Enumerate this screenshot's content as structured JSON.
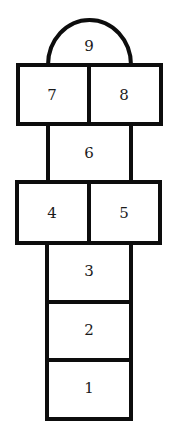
{
  "diagram": {
    "stroke_color": "#0d0d0d",
    "background": "#ffffff",
    "squares": [
      {
        "id": "sq9",
        "label": "9",
        "shape": "semicircle"
      },
      {
        "id": "sq7",
        "label": "7",
        "shape": "rect"
      },
      {
        "id": "sq8",
        "label": "8",
        "shape": "rect"
      },
      {
        "id": "sq6",
        "label": "6",
        "shape": "rect"
      },
      {
        "id": "sq4",
        "label": "4",
        "shape": "rect"
      },
      {
        "id": "sq5",
        "label": "5",
        "shape": "rect"
      },
      {
        "id": "sq3",
        "label": "3",
        "shape": "rect"
      },
      {
        "id": "sq2",
        "label": "2",
        "shape": "rect"
      },
      {
        "id": "sq1",
        "label": "1",
        "shape": "rect"
      }
    ]
  }
}
